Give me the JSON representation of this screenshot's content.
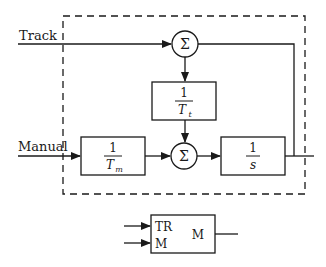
{
  "diagram": {
    "inputs": {
      "track": "Track",
      "manual": "Manual"
    },
    "blocks": {
      "tracking_gain": {
        "numerator": "1",
        "denominator": "T",
        "subscript": "t"
      },
      "manual_gain": {
        "numerator": "1",
        "denominator": "T",
        "subscript": "m"
      },
      "integrator": {
        "numerator": "1",
        "denominator": "s"
      }
    },
    "summing_junctions": {
      "top": "Σ",
      "bottom": "Σ"
    },
    "compact_block": {
      "input_tr": "TR",
      "input_m": "M",
      "output_m": "M"
    }
  }
}
